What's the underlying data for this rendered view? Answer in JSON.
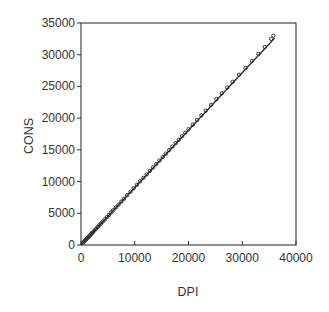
{
  "chart_data": {
    "type": "scatter",
    "title": "",
    "xlabel": "DPI",
    "ylabel": "CONS",
    "xlim": [
      0,
      40000
    ],
    "ylim": [
      0,
      35000
    ],
    "xticks": [
      0,
      10000,
      20000,
      30000,
      40000
    ],
    "yticks": [
      0,
      5000,
      10000,
      15000,
      20000,
      25000,
      30000,
      35000
    ],
    "xtick_labels": [
      "0",
      "10000",
      "20000",
      "30000",
      "40000"
    ],
    "ytick_labels": [
      "0",
      "5000",
      "10000",
      "15000",
      "20000",
      "25000",
      "30000",
      "35000"
    ],
    "grid": false,
    "legend": null,
    "marker": "open-circle",
    "fit_line": {
      "type": "linear",
      "x": [
        0,
        36000
      ],
      "y": [
        0,
        32600
      ]
    },
    "series": [
      {
        "name": "CONS vs DPI",
        "x": [
          400,
          600,
          800,
          1000,
          1200,
          1400,
          1600,
          1800,
          2000,
          2200,
          2500,
          2800,
          3100,
          3400,
          3700,
          4000,
          4400,
          4800,
          5200,
          5600,
          6000,
          6500,
          7000,
          7500,
          8000,
          8600,
          9200,
          9800,
          10400,
          11000,
          11600,
          12200,
          12800,
          13400,
          14000,
          14600,
          15200,
          15800,
          16400,
          17000,
          17600,
          18200,
          18800,
          19400,
          20000,
          20800,
          21600,
          22400,
          23200,
          24200,
          25200,
          26200,
          27200,
          28200,
          29400,
          30600,
          31800,
          33000,
          34200,
          35400,
          35800
        ],
        "y": [
          380,
          560,
          740,
          920,
          1100,
          1280,
          1460,
          1650,
          1830,
          2010,
          2280,
          2560,
          2830,
          3100,
          3380,
          3650,
          4010,
          4380,
          4740,
          5110,
          5480,
          5930,
          6380,
          6840,
          7300,
          7850,
          8390,
          8940,
          9490,
          10040,
          10580,
          11130,
          11680,
          12230,
          12760,
          13310,
          13870,
          14410,
          14960,
          15510,
          16050,
          16600,
          17150,
          17700,
          18250,
          18980,
          19710,
          20440,
          21170,
          22080,
          22990,
          23910,
          24820,
          25730,
          26830,
          27920,
          29020,
          30130,
          31220,
          32500,
          33000
        ]
      }
    ]
  }
}
